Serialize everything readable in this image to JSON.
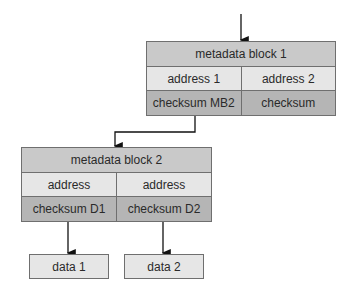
{
  "diagram": {
    "block1": {
      "title": "metadata block 1",
      "address_left": "address 1",
      "address_right": "address 2",
      "checksum_left": "checksum MB2",
      "checksum_right": "checksum"
    },
    "block2": {
      "title": "metadata block 2",
      "address_left": "address",
      "address_right": "address",
      "checksum_left": "checksum D1",
      "checksum_right": "checksum D2"
    },
    "data1": "data 1",
    "data2": "data 2"
  }
}
